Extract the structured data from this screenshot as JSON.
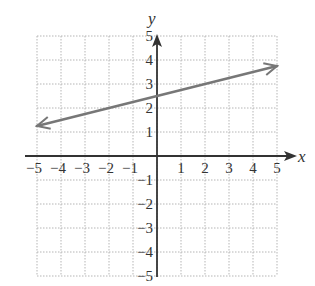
{
  "chart_data": {
    "type": "line",
    "title": "",
    "xlabel": "x",
    "ylabel": "y",
    "xlim": [
      -5,
      5
    ],
    "ylim": [
      -5,
      5
    ],
    "grid": true,
    "x_ticks": [
      "-5",
      "-4",
      "-3",
      "-2",
      "-1",
      "1",
      "2",
      "3",
      "4",
      "5"
    ],
    "y_ticks": [
      "5",
      "4",
      "3",
      "2",
      "1",
      "-1",
      "-2",
      "-3",
      "-4",
      "-5"
    ],
    "series": [
      {
        "name": "line",
        "x": [
          -5,
          5
        ],
        "y": [
          1.25,
          3.75
        ],
        "arrows": "both"
      }
    ],
    "colors": {
      "line": "#777777",
      "axis": "#333333",
      "grid": "#b5b5b5"
    }
  },
  "axes": {
    "x_label": "x",
    "y_label": "y"
  }
}
